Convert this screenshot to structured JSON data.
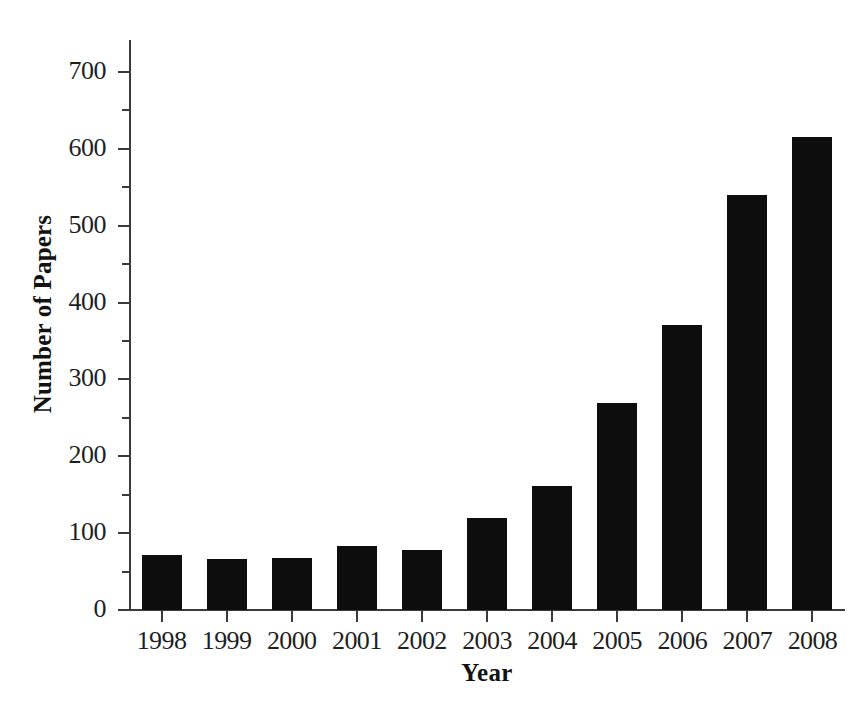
{
  "chart_data": {
    "type": "bar",
    "title": "",
    "xlabel": "Year",
    "ylabel": "Number of Papers",
    "categories": [
      "1998",
      "1999",
      "2000",
      "2001",
      "2002",
      "2003",
      "2004",
      "2005",
      "2006",
      "2007",
      "2008"
    ],
    "values": [
      72,
      66,
      68,
      83,
      78,
      120,
      161,
      269,
      371,
      540,
      616
    ],
    "series": [
      {
        "name": "Number of Papers",
        "values": [
          72,
          66,
          68,
          83,
          78,
          120,
          161,
          269,
          371,
          540,
          616
        ]
      }
    ],
    "ylim": [
      0,
      745
    ],
    "xlim_note": "categorical",
    "ytick_labels": [
      "0",
      "100",
      "200",
      "300",
      "400",
      "500",
      "600",
      "700"
    ],
    "ytick_values": [
      0,
      100,
      200,
      300,
      400,
      500,
      600,
      700
    ],
    "yminor_tick_values": [
      50,
      150,
      250,
      350,
      450,
      550,
      650
    ],
    "grid": false,
    "legend": false,
    "legend_position": "none",
    "bar_color": "#0d0d0d",
    "axis_color": "#3a3a3a",
    "background_color": "#ffffff"
  },
  "axes": {
    "y_title": "Number of Papers",
    "x_title": "Year"
  }
}
